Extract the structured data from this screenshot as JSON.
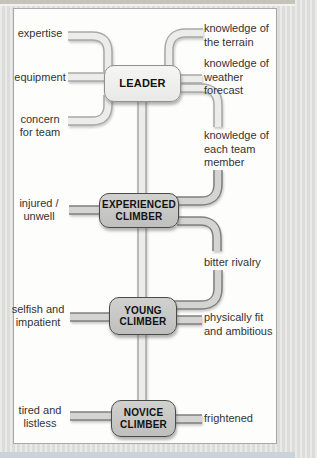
{
  "diagram_type": "concept-map",
  "colors": {
    "panel_bg": "#fdfdfc",
    "page_bg": "#dcdddb",
    "leader_box_fill": "#efefed",
    "climber_box_fill": "#c7c7c5",
    "pipe_light_fill": "#ececea",
    "pipe_light_outline": "#a8a8a8",
    "pipe_dark_fill": "#d4d4d2",
    "pipe_dark_outline": "#7f7f7f",
    "text": "#333333"
  },
  "diagram": {
    "nodes": [
      {
        "id": "leader",
        "label": "LEADER"
      },
      {
        "id": "experienced",
        "label": "EXPERIENCED CLIMBER"
      },
      {
        "id": "young",
        "label": "YOUNG CLIMBER"
      },
      {
        "id": "novice",
        "label": "NOVICE CLIMBER"
      }
    ],
    "attributes": [
      {
        "label": "expertise",
        "side": "left",
        "connects": [
          "leader"
        ]
      },
      {
        "label": "equipment",
        "side": "left",
        "connects": [
          "leader"
        ]
      },
      {
        "label": "concern for team",
        "side": "left",
        "connects": [
          "leader"
        ]
      },
      {
        "label": "knowledge of the terrain",
        "side": "right",
        "connects": [
          "leader"
        ]
      },
      {
        "label": "knowledge of weather forecast",
        "side": "right",
        "connects": [
          "leader"
        ]
      },
      {
        "label": "knowledge of each team member",
        "side": "right",
        "connects": [
          "leader",
          "experienced"
        ]
      },
      {
        "label": "injured / unwell",
        "side": "left",
        "connects": [
          "experienced"
        ]
      },
      {
        "label": "bitter rivalry",
        "side": "right",
        "connects": [
          "experienced",
          "young"
        ]
      },
      {
        "label": "selfish and impatient",
        "side": "left",
        "connects": [
          "young"
        ]
      },
      {
        "label": "physically fit and ambitious",
        "side": "right",
        "connects": [
          "young"
        ]
      },
      {
        "label": "tired and listless",
        "side": "left",
        "connects": [
          "novice"
        ]
      },
      {
        "label": "frightened",
        "side": "right",
        "connects": [
          "novice"
        ]
      }
    ],
    "hierarchy_edges": [
      [
        "leader",
        "experienced"
      ],
      [
        "experienced",
        "young"
      ],
      [
        "young",
        "novice"
      ]
    ]
  }
}
